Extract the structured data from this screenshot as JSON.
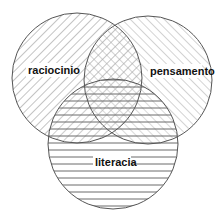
{
  "diagram": {
    "type": "venn",
    "sets": [
      {
        "label": "raciocinio",
        "pattern": "diagonal-hatch",
        "cx": 77,
        "cy": 78,
        "r": 65
      },
      {
        "label": "pensamento",
        "pattern": "diagonal-hatch-light",
        "cx": 148,
        "cy": 80,
        "r": 64
      },
      {
        "label": "literacia",
        "pattern": "horizontal-lines",
        "cx": 113,
        "cy": 144,
        "r": 65
      }
    ],
    "colors": {
      "stroke": "#555555",
      "hatch": "#888888",
      "text": "#111111",
      "background": "#ffffff"
    }
  }
}
